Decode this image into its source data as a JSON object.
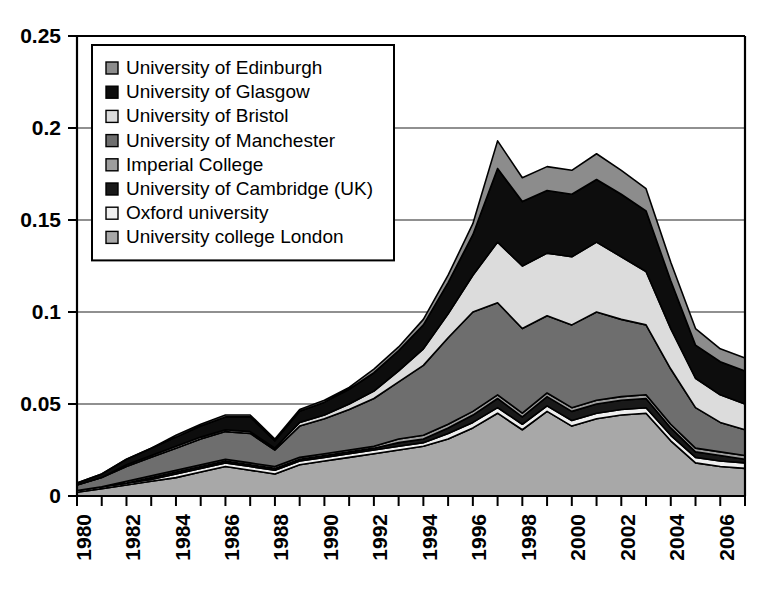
{
  "chart_data": {
    "type": "area",
    "title": "",
    "subtitle": "",
    "xlabel": "",
    "ylabel": "",
    "stacked": true,
    "grid": true,
    "grid_axis": "y",
    "legend_position": "top-left-inside",
    "ylim": [
      0,
      0.25
    ],
    "xlim": [
      1980,
      2007
    ],
    "ytick_labels": [
      "0",
      "0.05",
      "0.1",
      "0.15",
      "0.2",
      "0.25"
    ],
    "ytick_values": [
      0,
      0.05,
      0.1,
      0.15,
      0.2,
      0.25
    ],
    "xtick_labels": [
      "1980",
      "1982",
      "1984",
      "1986",
      "1988",
      "1990",
      "1992",
      "1994",
      "1996",
      "1998",
      "2000",
      "2002",
      "2004",
      "2006"
    ],
    "xtick_values": [
      1980,
      1982,
      1984,
      1986,
      1988,
      1990,
      1992,
      1994,
      1996,
      1998,
      2000,
      2002,
      2004,
      2006
    ],
    "x": [
      1980,
      1981,
      1982,
      1983,
      1984,
      1985,
      1986,
      1987,
      1988,
      1989,
      1990,
      1991,
      1992,
      1993,
      1994,
      1995,
      1996,
      1997,
      1998,
      1999,
      2000,
      2001,
      2002,
      2003,
      2004,
      2005,
      2006,
      2007
    ],
    "series": [
      {
        "name": "University college London",
        "color": "#a8a8a8",
        "stack_order": 1,
        "values": [
          0.002,
          0.004,
          0.006,
          0.008,
          0.01,
          0.013,
          0.016,
          0.014,
          0.012,
          0.017,
          0.019,
          0.021,
          0.023,
          0.025,
          0.027,
          0.031,
          0.037,
          0.045,
          0.036,
          0.046,
          0.038,
          0.042,
          0.044,
          0.045,
          0.03,
          0.018,
          0.016,
          0.015
        ]
      },
      {
        "name": "Oxford university",
        "color": "#efefef",
        "stack_order": 2,
        "values": [
          0.001,
          0.001,
          0.001,
          0.001,
          0.002,
          0.002,
          0.002,
          0.002,
          0.002,
          0.002,
          0.002,
          0.002,
          0.002,
          0.002,
          0.002,
          0.003,
          0.003,
          0.003,
          0.003,
          0.003,
          0.003,
          0.003,
          0.003,
          0.003,
          0.003,
          0.003,
          0.003,
          0.003
        ]
      },
      {
        "name": "University of Cambridge (UK)",
        "color": "#191919",
        "stack_order": 3,
        "values": [
          0.0,
          0.0,
          0.0,
          0.001,
          0.001,
          0.001,
          0.001,
          0.001,
          0.001,
          0.001,
          0.001,
          0.001,
          0.001,
          0.002,
          0.002,
          0.003,
          0.004,
          0.005,
          0.004,
          0.005,
          0.005,
          0.005,
          0.005,
          0.005,
          0.004,
          0.003,
          0.003,
          0.002
        ]
      },
      {
        "name": "Imperial College",
        "color": "#9d9d9d",
        "stack_order": 4,
        "values": [
          0.0,
          0.0,
          0.001,
          0.001,
          0.001,
          0.001,
          0.001,
          0.001,
          0.001,
          0.001,
          0.001,
          0.001,
          0.001,
          0.002,
          0.002,
          0.002,
          0.002,
          0.002,
          0.002,
          0.002,
          0.002,
          0.002,
          0.002,
          0.002,
          0.002,
          0.002,
          0.002,
          0.002
        ]
      },
      {
        "name": "University of Manchester",
        "color": "#6e6e6e",
        "stack_order": 5,
        "values": [
          0.003,
          0.005,
          0.008,
          0.01,
          0.012,
          0.014,
          0.015,
          0.016,
          0.009,
          0.017,
          0.019,
          0.022,
          0.026,
          0.031,
          0.038,
          0.047,
          0.054,
          0.05,
          0.046,
          0.042,
          0.045,
          0.048,
          0.042,
          0.038,
          0.03,
          0.022,
          0.016,
          0.014
        ]
      },
      {
        "name": "University of Bristol",
        "color": "#dcdcdc",
        "stack_order": 6,
        "values": [
          0.0,
          0.0,
          0.001,
          0.001,
          0.001,
          0.001,
          0.001,
          0.001,
          0.001,
          0.002,
          0.002,
          0.003,
          0.004,
          0.006,
          0.009,
          0.013,
          0.02,
          0.033,
          0.034,
          0.034,
          0.037,
          0.038,
          0.034,
          0.029,
          0.022,
          0.016,
          0.015,
          0.014
        ]
      },
      {
        "name": "University of Glasgow",
        "color": "#0d0d0d",
        "stack_order": 7,
        "values": [
          0.001,
          0.002,
          0.003,
          0.004,
          0.005,
          0.006,
          0.007,
          0.008,
          0.004,
          0.006,
          0.007,
          0.008,
          0.01,
          0.011,
          0.013,
          0.017,
          0.022,
          0.04,
          0.035,
          0.034,
          0.034,
          0.034,
          0.034,
          0.033,
          0.026,
          0.018,
          0.018,
          0.018
        ]
      },
      {
        "name": "University of Edinburgh",
        "color": "#8c8c8c",
        "stack_order": 8,
        "values": [
          0.0,
          0.0,
          0.0,
          0.0,
          0.001,
          0.001,
          0.001,
          0.001,
          0.001,
          0.001,
          0.001,
          0.001,
          0.002,
          0.002,
          0.003,
          0.004,
          0.006,
          0.015,
          0.013,
          0.013,
          0.013,
          0.014,
          0.013,
          0.012,
          0.01,
          0.009,
          0.007,
          0.007
        ]
      }
    ]
  },
  "legend": {
    "items": [
      {
        "label": "University of Edinburgh",
        "color": "#8c8c8c"
      },
      {
        "label": "University of Glasgow",
        "color": "#0d0d0d"
      },
      {
        "label": "University of Bristol",
        "color": "#dcdcdc"
      },
      {
        "label": "University of Manchester",
        "color": "#6e6e6e"
      },
      {
        "label": "Imperial College",
        "color": "#9d9d9d"
      },
      {
        "label": "University of Cambridge (UK)",
        "color": "#191919"
      },
      {
        "label": "Oxford university",
        "color": "#efefef"
      },
      {
        "label": "University college London",
        "color": "#a8a8a8"
      }
    ]
  },
  "colors": {
    "background": "#ffffff",
    "axis": "#000000",
    "grid": "#6b6b6b",
    "text": "#000000"
  }
}
